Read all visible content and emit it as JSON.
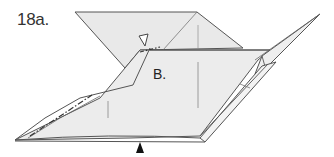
{
  "diagram": {
    "step_label": "18a.",
    "point_label": "B.",
    "colors": {
      "paper_fill": "#e9e9e9",
      "paper_fill_light": "#f0f0f0",
      "line": "#555555",
      "crease": "#888888",
      "arrow": "#111111"
    },
    "symbols": [
      {
        "name": "open-triangle-marker",
        "description": "hollow triangle pointer near top center"
      },
      {
        "name": "black-triangle-arrow",
        "description": "solid black upward arrow below bottom edge"
      },
      {
        "name": "dash-dot-fold-line",
        "description": "mountain fold line along left flap"
      }
    ]
  }
}
